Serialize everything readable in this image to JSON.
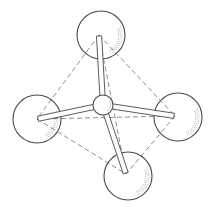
{
  "diagram": {
    "title": "",
    "type": "tetrahedral molecular model",
    "colors": {
      "stroke": "#4a4a4a",
      "dash": "#707070",
      "shade": "#b8b8b8",
      "background": "#ffffff"
    },
    "center_atom": {
      "id": "C",
      "x": 103,
      "y": 105,
      "r": 10
    },
    "outer_atoms": [
      {
        "id": "top",
        "x": 101,
        "y": 35,
        "r": 24,
        "vx": 99,
        "vy": 35
      },
      {
        "id": "left",
        "x": 37,
        "y": 119,
        "r": 24,
        "vx": 37,
        "vy": 119
      },
      {
        "id": "right",
        "x": 178,
        "y": 117,
        "r": 24,
        "vx": 175,
        "vy": 116
      },
      {
        "id": "bottom",
        "x": 128,
        "y": 176,
        "r": 24,
        "vx": 126,
        "vy": 174
      }
    ],
    "edges": [
      [
        "top",
        "left"
      ],
      [
        "top",
        "right"
      ],
      [
        "top",
        "bottom"
      ],
      [
        "left",
        "right"
      ],
      [
        "left",
        "bottom"
      ],
      [
        "right",
        "bottom"
      ]
    ],
    "bonds": [
      "top",
      "left",
      "right",
      "bottom"
    ]
  }
}
